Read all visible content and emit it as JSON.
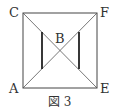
{
  "diagram": {
    "caption": "図 3",
    "points": {
      "C": {
        "label": "C",
        "x": 23,
        "y": 13
      },
      "F": {
        "label": "F",
        "x": 97,
        "y": 13
      },
      "A": {
        "label": "A",
        "x": 23,
        "y": 88
      },
      "E": {
        "label": "E",
        "x": 97,
        "y": 88
      },
      "B": {
        "label": "B"
      }
    },
    "line_color": "#444444",
    "thick_line_color": "#222222"
  }
}
